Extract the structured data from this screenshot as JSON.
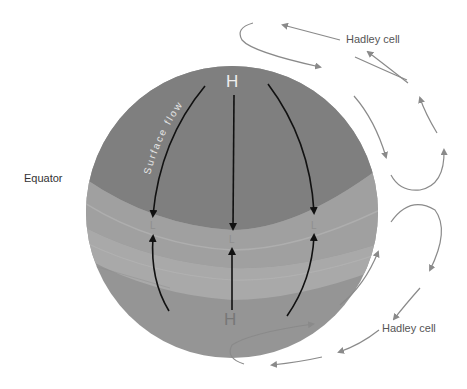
{
  "labels": {
    "equator": "Equator",
    "hadley_cell_top": "Hadley cell",
    "hadley_cell_bottom": "Hadley cell",
    "surface_flow": "Surface flow",
    "high_top": "H",
    "high_bottom": "H",
    "low_left": "L",
    "low_center": "L",
    "low_right": "L"
  },
  "colors": {
    "sphere_polar_north": "#7f7f7f",
    "sphere_band_mid": "#9a9a9a",
    "sphere_band_equator": "#a8a8a8",
    "sphere_band_south": "#959595",
    "flow_arrow": "#111111",
    "cell_arrow": "#8a8a8a",
    "text": "#333333"
  }
}
